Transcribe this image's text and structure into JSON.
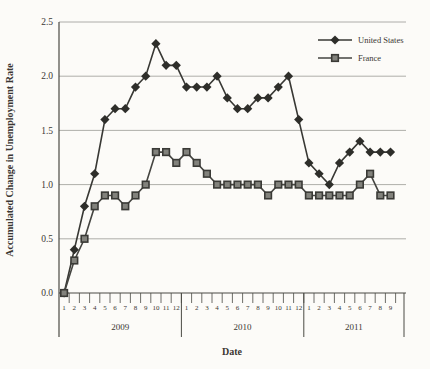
{
  "chart_data": {
    "type": "line",
    "title": "",
    "xlabel": "Date",
    "ylabel": "Accumulated Change in Unemployment Rate",
    "ylim": [
      0.0,
      2.5
    ],
    "ytick_step": 0.5,
    "yticks": [
      "0.0",
      "0.5",
      "1.0",
      "1.5",
      "2.0",
      "2.5"
    ],
    "grid": true,
    "legend_position": "top-right",
    "x_groups": [
      {
        "year": "2009",
        "months": [
          "1",
          "2",
          "3",
          "4",
          "5",
          "6",
          "7",
          "8",
          "9",
          "10",
          "11",
          "12"
        ]
      },
      {
        "year": "2010",
        "months": [
          "1",
          "2",
          "3",
          "4",
          "5",
          "6",
          "7",
          "8",
          "9",
          "10",
          "11",
          "12"
        ]
      },
      {
        "year": "2011",
        "months": [
          "1",
          "2",
          "3",
          "4",
          "5",
          "6",
          "7",
          "8",
          "9"
        ]
      }
    ],
    "series": [
      {
        "name": "United States",
        "marker": "diamond",
        "line_color": "#383834",
        "marker_fill": "#2e2e2a",
        "values": [
          0.0,
          0.4,
          0.8,
          1.1,
          1.6,
          1.7,
          1.7,
          1.9,
          2.0,
          2.3,
          2.1,
          2.1,
          1.9,
          1.9,
          1.9,
          2.0,
          1.8,
          1.7,
          1.7,
          1.8,
          1.8,
          1.9,
          2.0,
          1.6,
          1.2,
          1.1,
          1.0,
          1.2,
          1.3,
          1.4,
          1.3,
          1.3,
          1.3
        ]
      },
      {
        "name": "France",
        "marker": "square",
        "line_color": "#454541",
        "marker_fill": "#82827c",
        "marker_stroke": "#3a3a36",
        "values": [
          0.0,
          0.3,
          0.5,
          0.8,
          0.9,
          0.9,
          0.8,
          0.9,
          1.0,
          1.3,
          1.3,
          1.2,
          1.3,
          1.2,
          1.1,
          1.0,
          1.0,
          1.0,
          1.0,
          1.0,
          0.9,
          1.0,
          1.0,
          1.0,
          0.9,
          0.9,
          0.9,
          0.9,
          0.9,
          1.0,
          1.1,
          0.9,
          0.9
        ]
      }
    ],
    "colors": {
      "grid": "#9b9b95",
      "axis": "#4a4a44",
      "text": "#3b3733",
      "background": "#fcfbf8"
    }
  }
}
